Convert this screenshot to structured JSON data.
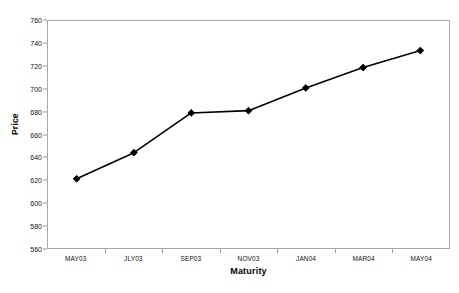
{
  "chart_data": {
    "type": "line",
    "title": "",
    "xlabel": "Maturity",
    "ylabel": "Price",
    "categories": [
      "MAY03",
      "JLY03",
      "SEP03",
      "NOV03",
      "JAN04",
      "MAR04",
      "MAY04"
    ],
    "values": [
      621,
      644,
      679,
      681,
      701,
      719,
      734
    ],
    "series": [
      {
        "name": "Price",
        "values": [
          621,
          644,
          679,
          681,
          701,
          719,
          734
        ]
      }
    ],
    "ylim": [
      560,
      760
    ],
    "ytick_step": 20,
    "yticks": [
      760,
      740,
      720,
      700,
      680,
      660,
      640,
      620,
      600,
      580,
      560
    ],
    "ytick_labels": [
      "760",
      "740",
      "720",
      "700",
      "680",
      "660",
      "640",
      "620",
      "600",
      "580",
      "560"
    ],
    "grid": false,
    "legend": false,
    "legend_position": "none",
    "marker": "diamond",
    "line_color": "#000000",
    "marker_color": "#000000",
    "frame_color": "#aaaaaa",
    "background_color": "#ffffff"
  }
}
